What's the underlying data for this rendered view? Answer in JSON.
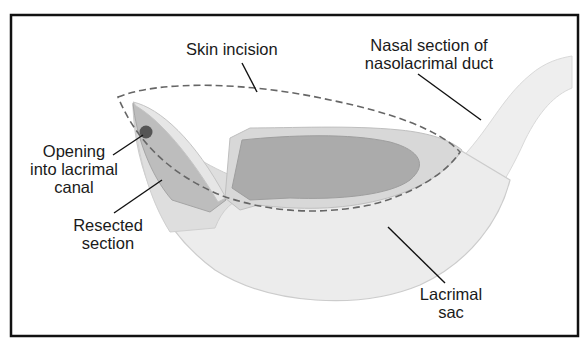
{
  "figure": {
    "colors": {
      "border": "#111111",
      "sac_fill": "#ececec",
      "sac_outline": "#cfcfcf",
      "duct_fill": "#eeeeee",
      "flap_fill": "#bdbdbd",
      "flap_rim": "#d6d6d6",
      "lumen_fill": "#aaaaaa",
      "resected_fill": "#dedede",
      "opening_dot": "#555555",
      "incision_dash": "#666666",
      "leader_line": "#111111"
    }
  },
  "labels": {
    "skin_incision": {
      "lines": [
        "Skin incision"
      ]
    },
    "nasal_section": {
      "lines": [
        "Nasal section of",
        "nasolacrimal duct"
      ]
    },
    "opening": {
      "lines": [
        "Opening",
        "into lacrimal",
        "canal"
      ]
    },
    "resected": {
      "lines": [
        "Resected",
        "section"
      ]
    },
    "lacrimal_sac": {
      "lines": [
        "Lacrimal",
        "sac"
      ]
    }
  }
}
